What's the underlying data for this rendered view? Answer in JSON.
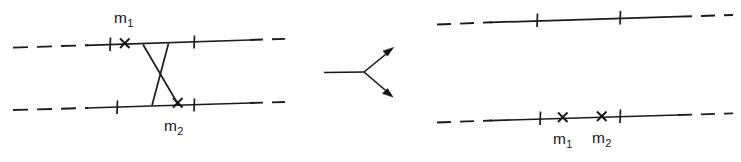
{
  "figure": {
    "type": "diagram",
    "background_color": "#ffffff",
    "ink_color": "#1b1b1b",
    "width": 741,
    "height": 162
  },
  "panels": {
    "left": {
      "name": "before-exchange",
      "upper_track": {
        "label": "upper-track",
        "tick_count": 2,
        "cross_count": 1,
        "cross_label": "m1"
      },
      "lower_track": {
        "label": "lower-track",
        "tick_count": 2,
        "cross_count": 1,
        "cross_label": "m2"
      },
      "crossing": {
        "label": "exchange-crossing",
        "shape": "X"
      }
    },
    "right": {
      "name": "after-exchange",
      "upper_track": {
        "label": "upper-track",
        "tick_count": 2,
        "cross_count": 0
      },
      "lower_track": {
        "label": "lower-track",
        "tick_count": 2,
        "cross_count": 2,
        "cross_labels": [
          "m1",
          "m2"
        ]
      }
    }
  },
  "arrow": {
    "name": "transition-arrow",
    "style": "forked",
    "head_count": 2,
    "direction": "rightward-splitting"
  },
  "labels": {
    "m1_upper_left": {
      "base": "m",
      "sub": "1"
    },
    "m2_lower_left": {
      "base": "m",
      "sub": "2"
    },
    "m1_lower_right": {
      "base": "m",
      "sub": "1"
    },
    "m2_lower_right": {
      "base": "m",
      "sub": "2"
    }
  }
}
